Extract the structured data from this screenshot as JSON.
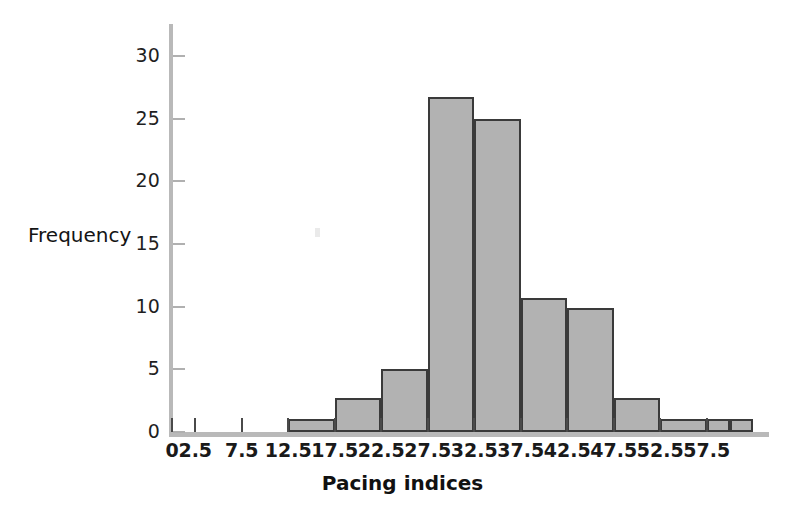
{
  "chart_data": {
    "type": "bar",
    "title": "",
    "subtitle": "",
    "xlabel": "Pacing indices",
    "ylabel": "Frequency",
    "grid": false,
    "legend": null,
    "xlim": [
      0,
      62.5
    ],
    "ylim": [
      0,
      31
    ],
    "x_tick_labels": [
      "0",
      "2.5",
      "7.5",
      "12.5",
      "17.5",
      "22.5",
      "27.5",
      "32.5",
      "37.5",
      "42.5",
      "47.5",
      "52.5",
      "57.5"
    ],
    "x_tick_values": [
      0,
      2.5,
      7.5,
      12.5,
      17.5,
      22.5,
      27.5,
      32.5,
      37.5,
      42.5,
      47.5,
      52.5,
      57.5
    ],
    "y_tick_labels": [
      "0",
      "5",
      "10",
      "15",
      "20",
      "25",
      "30"
    ],
    "y_tick_values": [
      0,
      5,
      10,
      15,
      20,
      25,
      30
    ],
    "bin_width": 5,
    "bins": [
      {
        "label": "12.5-17.5",
        "x0": 12.5,
        "x1": 17.5,
        "value": 1
      },
      {
        "label": "17.5-22.5",
        "x0": 17.5,
        "x1": 22.5,
        "value": 2.7
      },
      {
        "label": "22.5-27.5",
        "x0": 22.5,
        "x1": 27.5,
        "value": 5
      },
      {
        "label": "27.5-32.5",
        "x0": 27.5,
        "x1": 32.5,
        "value": 26.7
      },
      {
        "label": "32.5-37.5",
        "x0": 32.5,
        "x1": 37.5,
        "value": 25
      },
      {
        "label": "37.5-42.5",
        "x0": 37.5,
        "x1": 42.5,
        "value": 10.7
      },
      {
        "label": "42.5-47.5",
        "x0": 42.5,
        "x1": 47.5,
        "value": 9.9
      },
      {
        "label": "47.5-52.5",
        "x0": 47.5,
        "x1": 52.5,
        "value": 2.7
      },
      {
        "label": "52.5-57.5",
        "x0": 52.5,
        "x1": 57.5,
        "value": 1
      },
      {
        "label": "57.5-60.0",
        "x0": 57.5,
        "x1": 60.0,
        "value": 1
      },
      {
        "label": "60.0-62.5",
        "x0": 60.0,
        "x1": 62.5,
        "value": 1
      }
    ],
    "categories": [
      "12.5-17.5",
      "17.5-22.5",
      "22.5-27.5",
      "27.5-32.5",
      "32.5-37.5",
      "37.5-42.5",
      "42.5-47.5",
      "47.5-52.5",
      "52.5-57.5",
      "57.5-60.0",
      "60.0-62.5"
    ],
    "values": [
      1,
      2.7,
      5,
      26.7,
      25,
      10.7,
      9.9,
      2.7,
      1,
      1,
      1
    ],
    "colors": {
      "bar_fill": "#b2b2b2",
      "bar_edge": "#3a3a3a",
      "axis": "#b9b9b9",
      "tick": "#4a4a4a",
      "text": "#1a1a1a",
      "background": "#ffffff"
    }
  }
}
